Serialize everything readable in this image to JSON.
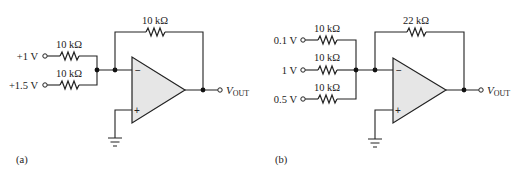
{
  "figure": "Two inverting summing amplifier circuits",
  "circuits": [
    {
      "id": "a",
      "caption": "(a)",
      "inputs": [
        {
          "voltage": "+1 V",
          "resistor": "10 kΩ"
        },
        {
          "voltage": "+1.5 V",
          "resistor": "10 kΩ"
        }
      ],
      "feedback_resistor": "10 kΩ",
      "opamp": {
        "inverting": "−",
        "noninverting": "+"
      },
      "output": {
        "v": "V",
        "sub": "OUT"
      }
    },
    {
      "id": "b",
      "caption": "(b)",
      "inputs": [
        {
          "voltage": "0.1 V",
          "resistor": "10 kΩ"
        },
        {
          "voltage": "1 V",
          "resistor": "10 kΩ"
        },
        {
          "voltage": "0.5 V",
          "resistor": "10 kΩ"
        }
      ],
      "feedback_resistor": "22 kΩ",
      "opamp": {
        "inverting": "−",
        "noninverting": "+"
      },
      "output": {
        "v": "V",
        "sub": "OUT"
      }
    }
  ],
  "colors": {
    "line": "#222222",
    "opamp_fill": "#e6e6e6",
    "background": "#ffffff"
  }
}
